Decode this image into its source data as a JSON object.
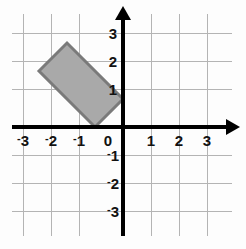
{
  "figure": {
    "width": 246,
    "height": 249,
    "background_color": "#fdfdfd"
  },
  "chart_data": {
    "type": "scatter",
    "title": "",
    "xlabel": "",
    "ylabel": "",
    "xlim": [
      -3.5,
      3.5
    ],
    "ylim": [
      -3.5,
      3.5
    ],
    "grid": true,
    "grid_color": "#b4b4b4",
    "grid_step": 1,
    "axis_color": "#000000",
    "legend": "none",
    "x_ticks": [
      -3,
      -2,
      -1,
      0,
      1,
      2,
      3
    ],
    "y_ticks": [
      3,
      2,
      1,
      -1,
      -2,
      -3
    ],
    "x_tick_labels": [
      "-3",
      "-2",
      "-1",
      "0",
      "1",
      "2",
      "3"
    ],
    "y_tick_labels": [
      "3",
      "2",
      "1",
      "-1",
      "-2",
      "-3"
    ],
    "series": [
      {
        "name": "parallelogram",
        "type": "polygon",
        "closed": true,
        "fill_color": "#a9a9a9",
        "fill_opacity": 1,
        "edge_color": "#7a7a7a",
        "edge_width": 3,
        "points": [
          {
            "x": -3,
            "y": 2
          },
          {
            "x": -2,
            "y": 3
          },
          {
            "x": 0,
            "y": 1
          },
          {
            "x": -1,
            "y": 0
          }
        ]
      }
    ]
  },
  "axes": {
    "x_axis_name": "x-axis",
    "y_axis_name": "y-axis",
    "arrow_heads": [
      "right",
      "up"
    ]
  },
  "ticks": {
    "x": [
      {
        "value": -3,
        "negative": true,
        "digit": "3",
        "px": 23
      },
      {
        "value": -2,
        "negative": true,
        "digit": "2",
        "px": 51
      },
      {
        "value": -1,
        "negative": true,
        "digit": "1",
        "px": 79
      },
      {
        "value": 0,
        "negative": false,
        "digit": "0",
        "px": 107
      },
      {
        "value": 1,
        "negative": false,
        "digit": "1",
        "px": 151
      },
      {
        "value": 2,
        "negative": false,
        "digit": "2",
        "px": 179
      },
      {
        "value": 3,
        "negative": false,
        "digit": "3",
        "px": 207
      }
    ],
    "y": [
      {
        "value": 3,
        "negative": false,
        "digit": "3",
        "px": 33
      },
      {
        "value": 2,
        "negative": false,
        "digit": "2",
        "px": 61
      },
      {
        "value": 1,
        "negative": false,
        "digit": "1",
        "px": 89
      },
      {
        "value": -1,
        "negative": true,
        "digit": "1",
        "px": 155
      },
      {
        "value": -2,
        "negative": true,
        "digit": "2",
        "px": 183
      },
      {
        "value": -3,
        "negative": true,
        "digit": "3",
        "px": 211
      }
    ]
  },
  "labels": {
    "neg_sign": "-",
    "x_neg_3": "3",
    "x_neg_2": "2",
    "x_neg_1": "1",
    "x_zero": "0",
    "x_pos_1": "1",
    "x_pos_2": "2",
    "x_pos_3": "3",
    "y_pos_3": "3",
    "y_pos_2": "2",
    "y_pos_1": "1",
    "y_neg_1": "1",
    "y_neg_2": "2",
    "y_neg_3": "3"
  }
}
